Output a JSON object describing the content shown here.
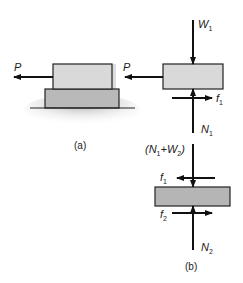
{
  "figure": {
    "panel_a": {
      "caption": "(a)",
      "force_label": "P",
      "upper_block_color": "#d9d9d9",
      "lower_block_color": "#b9b9b9"
    },
    "panel_b": {
      "caption": "(b)",
      "upper_fbd": {
        "weight_label": "W",
        "weight_sub": "1",
        "pull_label": "P",
        "friction_label": "f",
        "friction_sub": "1",
        "normal_label": "N",
        "normal_sub": "1",
        "block_color": "#d9d9d9"
      },
      "lower_fbd": {
        "load_label_open": "(N",
        "load_sub_1": "1",
        "load_plus": "+W",
        "load_sub_2": "2",
        "load_label_close": ")",
        "friction_top_label": "f",
        "friction_top_sub": "1",
        "friction_bottom_label": "f",
        "friction_bottom_sub": "2",
        "normal_label": "N",
        "normal_sub": "2",
        "block_color": "#b5b5b5"
      }
    }
  }
}
